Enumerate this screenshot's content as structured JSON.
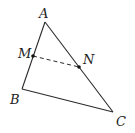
{
  "diagram": {
    "type": "triangle-midsegment",
    "colors": {
      "stroke": "#2a2a2a",
      "background": "#ffffff"
    },
    "points": {
      "A": {
        "label": "A",
        "x": 45,
        "y": 22,
        "lx": 39,
        "ly": 18
      },
      "B": {
        "label": "B",
        "x": 22,
        "y": 89,
        "lx": 10,
        "ly": 104
      },
      "C": {
        "label": "C",
        "x": 113,
        "y": 112,
        "lx": 116,
        "ly": 126
      },
      "M": {
        "label": "M",
        "x": 33,
        "y": 56,
        "lx": 18,
        "ly": 58
      },
      "N": {
        "label": "N",
        "x": 79,
        "y": 67,
        "lx": 83,
        "ly": 64
      }
    },
    "segments": [
      {
        "from": "A",
        "to": "B",
        "style": "solid"
      },
      {
        "from": "B",
        "to": "C",
        "style": "solid"
      },
      {
        "from": "C",
        "to": "A",
        "style": "solid"
      },
      {
        "from": "M",
        "to": "N",
        "style": "dashed"
      }
    ]
  }
}
